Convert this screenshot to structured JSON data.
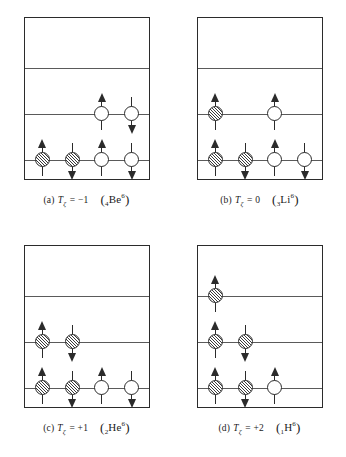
{
  "figure": {
    "columns_pct": [
      14,
      38,
      62,
      86
    ],
    "levels_pct": [
      31,
      59.5,
      88
    ],
    "panels": [
      {
        "id": "panel-a",
        "tag": "(a)",
        "symbol": "T",
        "subscript": "ζ",
        "equals": "=",
        "value": "−1",
        "nuclide_open": "(",
        "nuclide_z": "4",
        "nuclide_el": "Be",
        "nuclide_a": "6",
        "nuclide_close": ")",
        "nucleons": [
          {
            "level": 1,
            "column": 2,
            "kind": "proton",
            "spin": "up"
          },
          {
            "level": 1,
            "column": 3,
            "kind": "proton",
            "spin": "down"
          },
          {
            "level": 2,
            "column": 0,
            "kind": "neutron",
            "spin": "up"
          },
          {
            "level": 2,
            "column": 1,
            "kind": "neutron",
            "spin": "down"
          },
          {
            "level": 2,
            "column": 2,
            "kind": "proton",
            "spin": "up"
          },
          {
            "level": 2,
            "column": 3,
            "kind": "proton",
            "spin": "down"
          }
        ]
      },
      {
        "id": "panel-b",
        "tag": "(b)",
        "symbol": "T",
        "subscript": "ζ",
        "equals": "=",
        "value": "0",
        "nuclide_open": "(",
        "nuclide_z": "3",
        "nuclide_el": "Li",
        "nuclide_a": "6",
        "nuclide_close": ")",
        "nucleons": [
          {
            "level": 1,
            "column": 0,
            "kind": "neutron",
            "spin": "up"
          },
          {
            "level": 1,
            "column": 2,
            "kind": "proton",
            "spin": "up"
          },
          {
            "level": 2,
            "column": 0,
            "kind": "neutron",
            "spin": "up"
          },
          {
            "level": 2,
            "column": 1,
            "kind": "neutron",
            "spin": "down"
          },
          {
            "level": 2,
            "column": 2,
            "kind": "proton",
            "spin": "up"
          },
          {
            "level": 2,
            "column": 3,
            "kind": "proton",
            "spin": "down"
          }
        ]
      },
      {
        "id": "panel-c",
        "tag": "(c)",
        "symbol": "T",
        "subscript": "ζ",
        "equals": "=",
        "value": "+1",
        "nuclide_open": "(",
        "nuclide_z": "2",
        "nuclide_el": "He",
        "nuclide_a": "6",
        "nuclide_close": ")",
        "nucleons": [
          {
            "level": 1,
            "column": 0,
            "kind": "neutron",
            "spin": "up"
          },
          {
            "level": 1,
            "column": 1,
            "kind": "neutron",
            "spin": "down"
          },
          {
            "level": 2,
            "column": 0,
            "kind": "neutron",
            "spin": "up"
          },
          {
            "level": 2,
            "column": 1,
            "kind": "neutron",
            "spin": "down"
          },
          {
            "level": 2,
            "column": 2,
            "kind": "proton",
            "spin": "up"
          },
          {
            "level": 2,
            "column": 3,
            "kind": "proton",
            "spin": "down"
          }
        ]
      },
      {
        "id": "panel-d",
        "tag": "(d)",
        "symbol": "T",
        "subscript": "ζ",
        "equals": "=",
        "value": "+2",
        "nuclide_open": "(",
        "nuclide_z": "1",
        "nuclide_el": "H",
        "nuclide_a": "6",
        "nuclide_close": ")",
        "nucleons": [
          {
            "level": 0,
            "column": 0,
            "kind": "neutron",
            "spin": "up"
          },
          {
            "level": 1,
            "column": 0,
            "kind": "neutron",
            "spin": "up"
          },
          {
            "level": 1,
            "column": 1,
            "kind": "neutron",
            "spin": "down"
          },
          {
            "level": 2,
            "column": 0,
            "kind": "neutron",
            "spin": "up"
          },
          {
            "level": 2,
            "column": 1,
            "kind": "neutron",
            "spin": "down"
          },
          {
            "level": 2,
            "column": 2,
            "kind": "proton",
            "spin": "up"
          }
        ]
      }
    ]
  }
}
